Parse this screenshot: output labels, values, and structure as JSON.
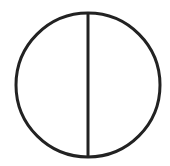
{
  "diagram": {
    "type": "circle-divided-by-vertical-diameter",
    "stroke_color": "#222222",
    "background_color": "#ffffff",
    "circle": {
      "cx": 88,
      "cy": 85,
      "r": 72,
      "stroke_width": 3
    },
    "diameter": {
      "x": 88,
      "y1": 13,
      "y2": 157,
      "stroke_width": 3
    }
  }
}
